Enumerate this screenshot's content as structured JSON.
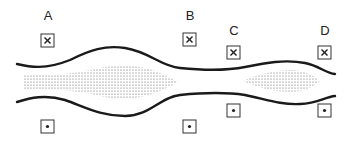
{
  "diagram": {
    "type": "blood-vessel-flow-schematic",
    "colors": {
      "wall": "#1a1a1a",
      "box_border": "#333333",
      "stipple": "#555555",
      "background": "#ffffff"
    },
    "stations": [
      {
        "label": "A",
        "top_symbol": "x",
        "bottom_symbol": "dot",
        "top_symbol_name": "into-page",
        "bottom_symbol_name": "out-of-page"
      },
      {
        "label": "B",
        "top_symbol": "x",
        "bottom_symbol": "dot",
        "top_symbol_name": "into-page",
        "bottom_symbol_name": "out-of-page"
      },
      {
        "label": "C",
        "top_symbol": "x",
        "bottom_symbol": "dot",
        "top_symbol_name": "into-page",
        "bottom_symbol_name": "out-of-page"
      },
      {
        "label": "D",
        "top_symbol": "x",
        "bottom_symbol": "dot",
        "top_symbol_name": "into-page",
        "bottom_symbol_name": "out-of-page"
      }
    ],
    "regions": [
      {
        "name": "left-stippled-bulge",
        "pattern": "dots"
      },
      {
        "name": "right-stippled-bulge",
        "pattern": "dots"
      }
    ]
  }
}
